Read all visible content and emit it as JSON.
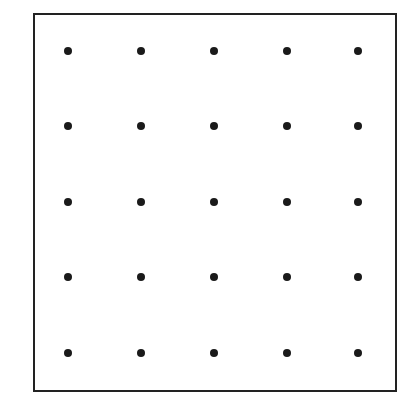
{
  "diagram": {
    "type": "dot-grid",
    "rows": 5,
    "columns": 5,
    "frame": {
      "left": 33,
      "top": 13,
      "right": 396,
      "bottom": 390,
      "border_color": "#222222"
    },
    "dot_color": "#1a1a1a",
    "column_x": [
      68,
      141,
      214,
      287,
      358
    ],
    "row_y": [
      51,
      126,
      202,
      277,
      353
    ]
  }
}
